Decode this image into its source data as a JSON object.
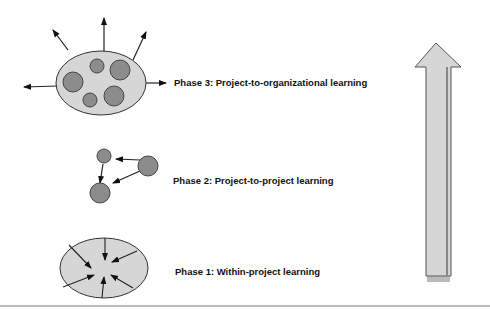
{
  "diagram": {
    "phases": [
      {
        "id": 3,
        "label": "Phase 3: Project-to-organizational learning"
      },
      {
        "id": 2,
        "label": "Phase 2: Project-to-project learning"
      },
      {
        "id": 1,
        "label": "Phase 1: Within-project learning"
      }
    ],
    "icons": {
      "phase3": "ellipse-with-circles-outward-arrows",
      "phase2": "three-circles-connected-arrows",
      "phase1": "ellipse-inward-arrows",
      "progress": "up-arrow"
    },
    "colors": {
      "fill_light": "#d6d6d6",
      "fill_dark": "#8c8c8c",
      "stroke": "#222222"
    }
  }
}
